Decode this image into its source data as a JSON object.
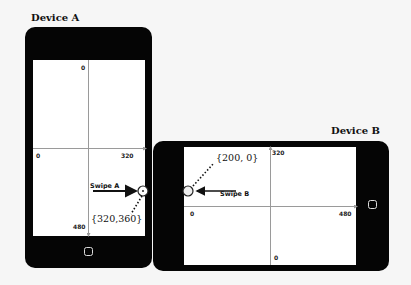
{
  "device_a": {
    "title": "Device A",
    "orientation": "portrait",
    "x_axis": {
      "min_label": "0",
      "max_label": "320"
    },
    "y_axis": {
      "min_label": "0",
      "max_label": "480"
    },
    "swipe_label": "Swipe A",
    "swipe_direction": "right",
    "touch_point_label": "{320,360}"
  },
  "device_b": {
    "title": "Device B",
    "orientation": "landscape",
    "x_axis": {
      "min_label": "0",
      "max_label": "480"
    },
    "y_axis": {
      "min_label": "0",
      "max_label": "320"
    },
    "swipe_label": "Swipe B",
    "swipe_direction": "left",
    "touch_point_label": "{200, 0}"
  },
  "colors": {
    "frame": "#050505",
    "screen": "#ffffff",
    "axis": "#9a9a9a",
    "background": "#f6f6f6"
  }
}
